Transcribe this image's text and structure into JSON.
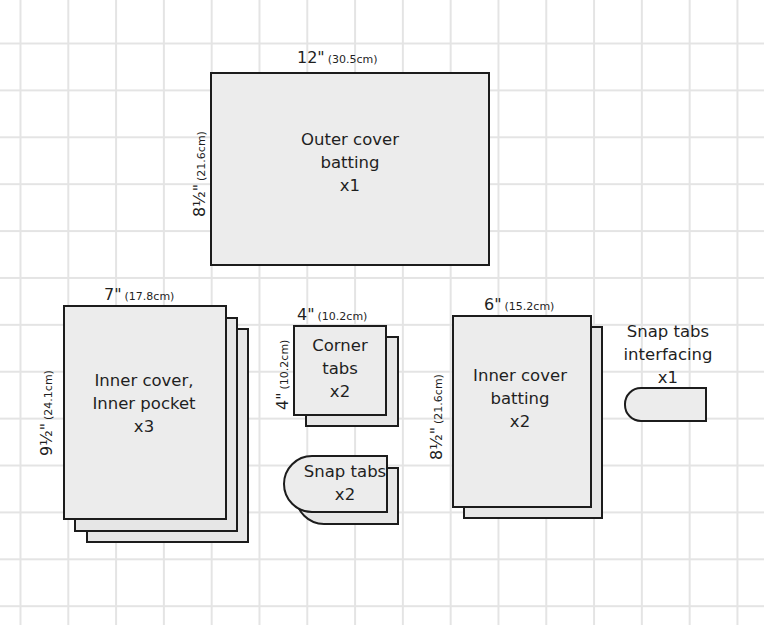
{
  "diagram": {
    "type": "sewing-pattern-cutting-layout",
    "background": "graph-paper-grid",
    "colors": {
      "piece_fill": "#ececec",
      "piece_stroke": "#1c1c1c",
      "grid_line": "#e4e4e4",
      "text": "#1f1f1f"
    },
    "pieces": [
      {
        "id": "outer-cover-batting",
        "label_lines": [
          "Outer cover",
          "batting",
          "x1"
        ],
        "width": {
          "imperial": "12\"",
          "metric": "(30.5cm)"
        },
        "height": {
          "imperial": "8½\"",
          "metric": "(21.6cm)"
        },
        "quantity": 1,
        "shape": "rectangle"
      },
      {
        "id": "inner-cover-inner-pocket",
        "label_lines": [
          "Inner cover,",
          "Inner pocket",
          "x3"
        ],
        "width": {
          "imperial": "7\"",
          "metric": "(17.8cm)"
        },
        "height": {
          "imperial": "9½\"",
          "metric": "(24.1cm)"
        },
        "quantity": 3,
        "shape": "rectangle-stack"
      },
      {
        "id": "corner-tabs",
        "label_lines": [
          "Corner",
          "tabs",
          "x2"
        ],
        "width": {
          "imperial": "4\"",
          "metric": "(10.2cm)"
        },
        "height": {
          "imperial": "4\"",
          "metric": "(10.2cm)"
        },
        "quantity": 2,
        "shape": "square-stack"
      },
      {
        "id": "snap-tabs",
        "label_lines": [
          "Snap tabs",
          "x2"
        ],
        "quantity": 2,
        "shape": "rounded-tab-stack"
      },
      {
        "id": "inner-cover-batting",
        "label_lines": [
          "Inner cover",
          "batting",
          "x2"
        ],
        "width": {
          "imperial": "6\"",
          "metric": "(15.2cm)"
        },
        "height": {
          "imperial": "8½\"",
          "metric": "(21.6cm)"
        },
        "quantity": 2,
        "shape": "rectangle-stack"
      },
      {
        "id": "snap-tabs-interfacing",
        "label_lines": [
          "Snap tabs",
          "interfacing",
          "x1"
        ],
        "quantity": 1,
        "shape": "rounded-tab"
      }
    ]
  }
}
